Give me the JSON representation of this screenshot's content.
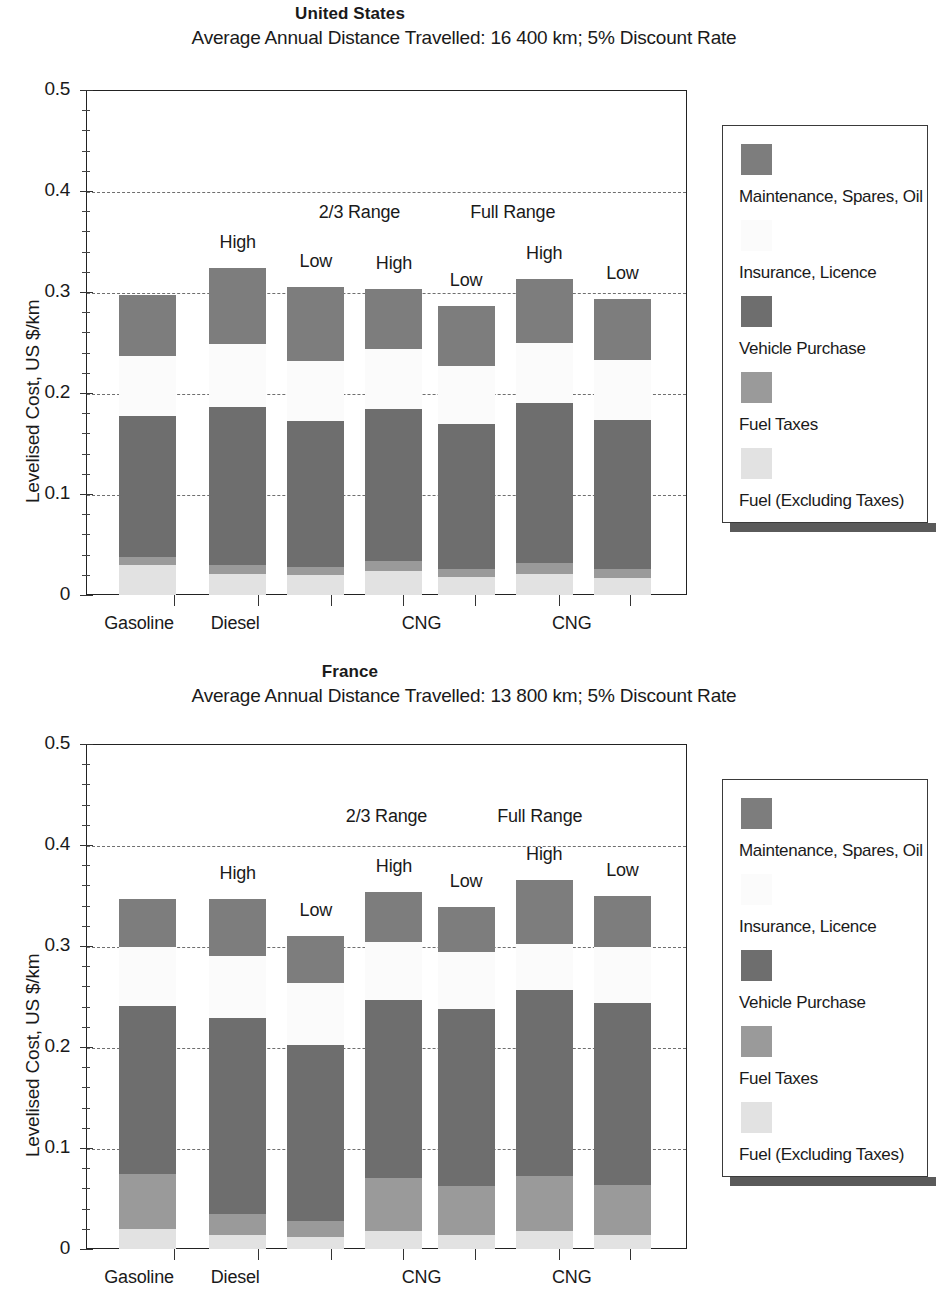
{
  "chart_data": [
    {
      "type": "bar",
      "title": "United States",
      "subtitle": "Average Annual Distance Travelled: 16 400 km; 5% Discount Rate",
      "ylabel": "Levelised Cost, US $/km",
      "xlabel": "",
      "ylim": [
        0,
        0.5
      ],
      "ytick_labels": [
        "0",
        "0.1",
        "0.2",
        "0.3",
        "0.4",
        "0.5"
      ],
      "ytick_values": [
        0,
        0.1,
        0.2,
        0.3,
        0.4,
        0.5
      ],
      "gridlines": [
        0.1,
        0.2,
        0.3,
        0.4
      ],
      "grid": true,
      "legend_position": "right",
      "categories": [
        "Gasoline",
        "Diesel",
        "CNG",
        "CNG"
      ],
      "range_notes": [
        {
          "text": "2/3 Range",
          "x_center": 0.455
        },
        {
          "text": "Full Range",
          "x_center": 0.71
        }
      ],
      "bars": [
        {
          "note": "",
          "fuel": 0.03,
          "fuel_taxes": 0.008,
          "vehicle_purchase": 0.139,
          "insurance": 0.06,
          "maintenance": 0.06,
          "top": 0.297
        },
        {
          "note": "High",
          "fuel": 0.021,
          "fuel_taxes": 0.009,
          "vehicle_purchase": 0.156,
          "insurance": 0.063,
          "maintenance": 0.075,
          "top": 0.324
        },
        {
          "note": "Low",
          "fuel": 0.02,
          "fuel_taxes": 0.008,
          "vehicle_purchase": 0.144,
          "insurance": 0.06,
          "maintenance": 0.073,
          "top": 0.305
        },
        {
          "note": "High",
          "fuel": 0.024,
          "fuel_taxes": 0.01,
          "vehicle_purchase": 0.15,
          "insurance": 0.06,
          "maintenance": 0.059,
          "top": 0.303
        },
        {
          "note": "Low",
          "fuel": 0.018,
          "fuel_taxes": 0.008,
          "vehicle_purchase": 0.143,
          "insurance": 0.058,
          "maintenance": 0.059,
          "top": 0.286
        },
        {
          "note": "High",
          "fuel": 0.021,
          "fuel_taxes": 0.011,
          "vehicle_purchase": 0.158,
          "insurance": 0.06,
          "maintenance": 0.063,
          "top": 0.313
        },
        {
          "note": "Low",
          "fuel": 0.017,
          "fuel_taxes": 0.009,
          "vehicle_purchase": 0.147,
          "insurance": 0.06,
          "maintenance": 0.06,
          "top": 0.293
        }
      ],
      "legend": [
        {
          "label": "Maintenance, Spares, Oil",
          "color": "#7d7d7d"
        },
        {
          "label": "Insurance, Licence",
          "color": "#fbfbfb"
        },
        {
          "label": "Vehicle Purchase",
          "color": "#6e6e6e"
        },
        {
          "label": "Fuel Taxes",
          "color": "#9a9a9a"
        },
        {
          "label": "Fuel (Excluding Taxes)",
          "color": "#e2e2e2"
        }
      ]
    },
    {
      "type": "bar",
      "title": "France",
      "subtitle": "Average Annual Distance Travelled: 13 800 km; 5% Discount Rate",
      "ylabel": "Levelised Cost, US $/km",
      "xlabel": "",
      "ylim": [
        0,
        0.5
      ],
      "ytick_labels": [
        "0",
        "0.1",
        "0.2",
        "0.3",
        "0.4",
        "0.5"
      ],
      "ytick_values": [
        0,
        0.1,
        0.2,
        0.3,
        0.4,
        0.5
      ],
      "gridlines": [
        0.1,
        0.2,
        0.3,
        0.4
      ],
      "grid": true,
      "legend_position": "right",
      "categories": [
        "Gasoline",
        "Diesel",
        "CNG",
        "CNG"
      ],
      "range_notes": [
        {
          "text": "2/3 Range",
          "x_center": 0.5
        },
        {
          "text": "Full Range",
          "x_center": 0.755
        }
      ],
      "bars": [
        {
          "note": "",
          "fuel": 0.02,
          "fuel_taxes": 0.054,
          "vehicle_purchase": 0.167,
          "insurance": 0.058,
          "maintenance": 0.048,
          "top": 0.347
        },
        {
          "note": "High",
          "fuel": 0.014,
          "fuel_taxes": 0.021,
          "vehicle_purchase": 0.194,
          "insurance": 0.061,
          "maintenance": 0.057,
          "top": 0.347
        },
        {
          "note": "Low",
          "fuel": 0.012,
          "fuel_taxes": 0.016,
          "vehicle_purchase": 0.174,
          "insurance": 0.061,
          "maintenance": 0.047,
          "top": 0.31
        },
        {
          "note": "High",
          "fuel": 0.018,
          "fuel_taxes": 0.052,
          "vehicle_purchase": 0.177,
          "insurance": 0.057,
          "maintenance": 0.049,
          "top": 0.353
        },
        {
          "note": "Low",
          "fuel": 0.014,
          "fuel_taxes": 0.048,
          "vehicle_purchase": 0.176,
          "insurance": 0.056,
          "maintenance": 0.045,
          "top": 0.339
        },
        {
          "note": "High",
          "fuel": 0.018,
          "fuel_taxes": 0.054,
          "vehicle_purchase": 0.184,
          "insurance": 0.046,
          "maintenance": 0.063,
          "top": 0.365
        },
        {
          "note": "Low",
          "fuel": 0.014,
          "fuel_taxes": 0.049,
          "vehicle_purchase": 0.181,
          "insurance": 0.055,
          "maintenance": 0.051,
          "top": 0.35
        }
      ],
      "legend": [
        {
          "label": "Maintenance, Spares, Oil",
          "color": "#7d7d7d"
        },
        {
          "label": "Insurance, Licence",
          "color": "#fbfbfb"
        },
        {
          "label": "Vehicle Purchase",
          "color": "#6e6e6e"
        },
        {
          "label": "Fuel Taxes",
          "color": "#9a9a9a"
        },
        {
          "label": "Fuel (Excluding Taxes)",
          "color": "#e2e2e2"
        }
      ]
    }
  ]
}
